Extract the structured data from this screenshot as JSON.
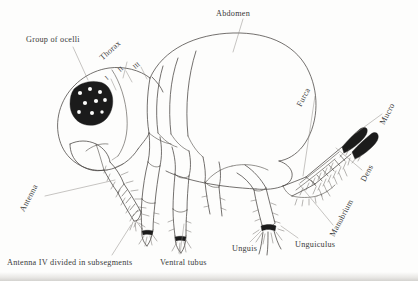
{
  "figure": {
    "style": "ink line drawing, scanned",
    "background_color": "#fdfdfc",
    "ink_color": "#3a3a3a"
  },
  "labels": [
    {
      "id": "group-of-ocelli",
      "text": "Group of ocelli",
      "x": 26,
      "y": 36,
      "rotation": 0
    },
    {
      "id": "thorax",
      "text": "Thorax",
      "x": 104,
      "y": 54,
      "rotation": -42
    },
    {
      "id": "abdomen",
      "text": "Abdomen",
      "x": 216,
      "y": 10,
      "rotation": 0
    },
    {
      "id": "furca",
      "text": "Furca",
      "x": 303,
      "y": 100,
      "rotation": -62
    },
    {
      "id": "mucro",
      "text": "Mucro",
      "x": 386,
      "y": 118,
      "rotation": -62
    },
    {
      "id": "dens",
      "text": "Dens",
      "x": 367,
      "y": 175,
      "rotation": -62
    },
    {
      "id": "manubrium",
      "text": "Manubrium",
      "x": 336,
      "y": 230,
      "rotation": -62
    },
    {
      "id": "unguiculus",
      "text": "Unguiculus",
      "x": 295,
      "y": 241,
      "rotation": 0
    },
    {
      "id": "unguis",
      "text": "Unguis",
      "x": 232,
      "y": 245,
      "rotation": 0
    },
    {
      "id": "ventral-tubus",
      "text": "Ventral tubus",
      "x": 160,
      "y": 259,
      "rotation": 0
    },
    {
      "id": "antenna-iv",
      "text": "Antenna IV divided in subsegments",
      "x": 7,
      "y": 259,
      "rotation": 0
    },
    {
      "id": "antenna",
      "text": "Antenna",
      "x": 26,
      "y": 205,
      "rotation": -62
    }
  ],
  "segment_numerals": [
    {
      "id": "thorax-i",
      "text": "I",
      "x": 108,
      "y": 74
    },
    {
      "id": "thorax-ii",
      "text": "II",
      "x": 121,
      "y": 66
    },
    {
      "id": "thorax-iii",
      "text": "III",
      "x": 136,
      "y": 63
    }
  ],
  "anatomy_parts": [
    "head",
    "group of ocelli",
    "antenna",
    "antenna IV subsegments",
    "thorax I",
    "thorax II",
    "thorax III",
    "abdomen",
    "leg",
    "unguis",
    "unguiculus",
    "ventral tubus",
    "furca",
    "manubrium",
    "dens",
    "mucro"
  ]
}
